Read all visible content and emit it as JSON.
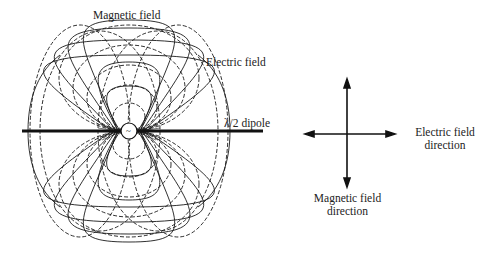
{
  "labels": {
    "magnetic_field": "Magnetic field",
    "electric_field": "Electric field",
    "dipole": "λ/2 dipole",
    "electric_direction_line1": "Electric field",
    "electric_direction_line2": "direction",
    "magnetic_direction_line1": "Magnetic field",
    "magnetic_direction_line2": "direction"
  },
  "icons": {
    "source": "~"
  },
  "colors": {
    "line": "#1a1a1a",
    "background": "#ffffff"
  }
}
